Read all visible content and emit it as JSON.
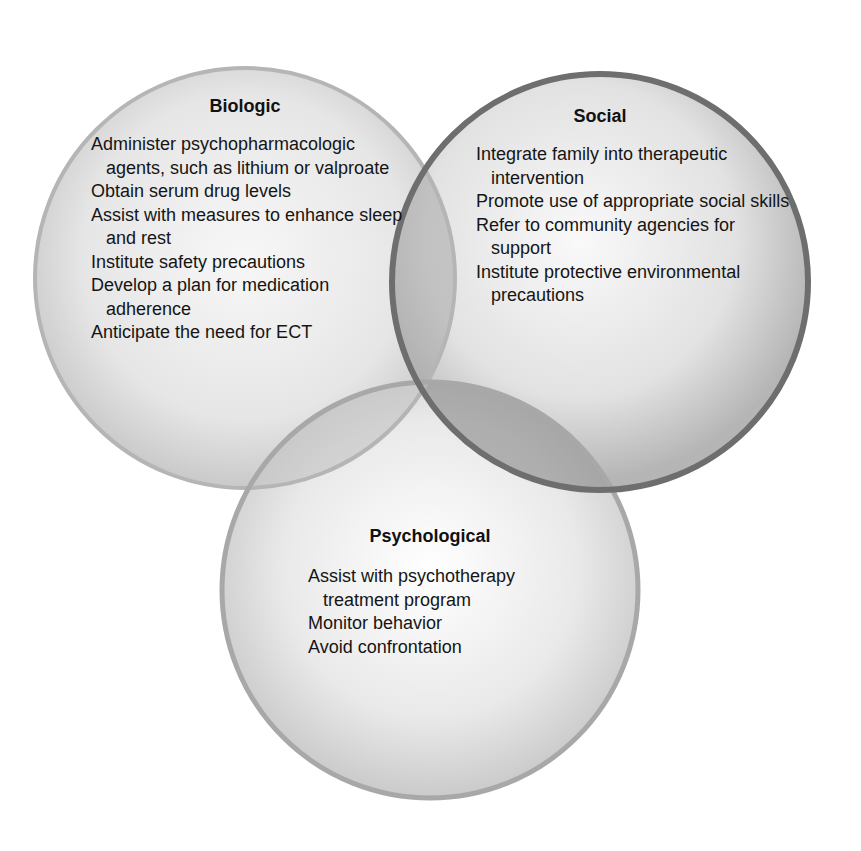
{
  "diagram": {
    "type": "venn",
    "circles": [
      {
        "id": "biologic",
        "title": "Biologic",
        "edge_color": "#b8b8b8",
        "items": [
          "Administer psychopharmacologic agents, such as lithium or valproate",
          "Obtain serum drug levels",
          "Assist with measures to enhance sleep and rest",
          "Institute safety precautions",
          "Develop a plan for medication adherence",
          "Anticipate the need for ECT"
        ]
      },
      {
        "id": "social",
        "title": "Social",
        "edge_color": "#6a6a6a",
        "items": [
          "Integrate family into therapeutic intervention",
          "Promote use of appropriate social skills",
          "Refer to community agencies for support",
          "Institute protective environmental precautions"
        ]
      },
      {
        "id": "psychological",
        "title": "Psychological",
        "edge_color": "#a0a0a0",
        "items": [
          "Assist with psychotherapy treatment program",
          "Monitor behavior",
          "Avoid confrontation"
        ]
      }
    ]
  }
}
